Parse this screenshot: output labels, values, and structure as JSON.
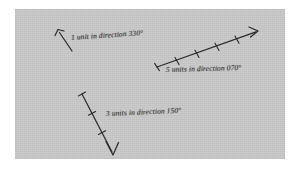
{
  "figure": {
    "background_color": "#ffffff",
    "panel_color": "#c9c9c9",
    "ink_color": "#2b2b2b",
    "title": "",
    "caption": ""
  },
  "vectors": [
    {
      "id": "vector-1-unit-330",
      "label": "1 unit in direction 330°",
      "magnitude": 1,
      "magnitude_text": "1",
      "unit_word": "unit",
      "bearing": 330,
      "bearing_text": "330°",
      "tick_count": 0,
      "tail": {
        "x": 72,
        "y": 51
      },
      "head": {
        "x": 58,
        "y": 30
      },
      "has_tail_cap": false,
      "has_arrow_head": true
    },
    {
      "id": "vector-5-units-070",
      "label": "5 units in direction 070°",
      "magnitude": 5,
      "magnitude_text": "5",
      "unit_word": "units",
      "bearing": 70,
      "bearing_text": "070°",
      "tick_count": 4,
      "tail": {
        "x": 157,
        "y": 67
      },
      "head": {
        "x": 258,
        "y": 31
      },
      "has_tail_cap": true,
      "has_arrow_head": true
    },
    {
      "id": "vector-3-units-150",
      "label": "3 units in direction 150°",
      "magnitude": 3,
      "magnitude_text": "3",
      "unit_word": "units",
      "bearing": 150,
      "bearing_text": "150°",
      "tick_count": 2,
      "tail": {
        "x": 82,
        "y": 94
      },
      "head": {
        "x": 113,
        "y": 155
      },
      "has_tail_cap": true,
      "has_arrow_head": true
    }
  ]
}
